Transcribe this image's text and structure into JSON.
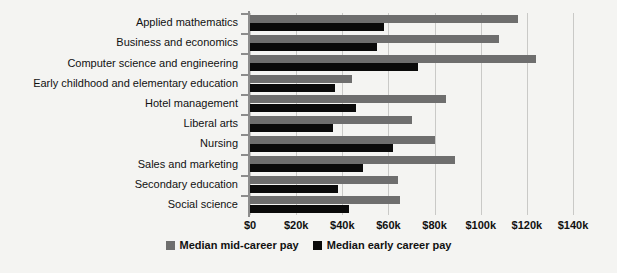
{
  "chart_data": {
    "type": "bar",
    "orientation": "horizontal",
    "title": "",
    "xlabel": "",
    "ylabel": "",
    "xlim": [
      0,
      140000
    ],
    "xticks": [
      0,
      20000,
      40000,
      60000,
      80000,
      100000,
      120000,
      140000
    ],
    "xtick_labels": [
      "$0",
      "$20k",
      "$40k",
      "$60k",
      "$80k",
      "$100k",
      "$120k",
      "$140k"
    ],
    "grid": true,
    "legend_position": "bottom-center",
    "categories": [
      "Applied mathematics",
      "Business and economics",
      "Computer science and engineering",
      "Early childhood and elementary education",
      "Hotel management",
      "Liberal arts",
      "Nursing",
      "Sales and marketing",
      "Secondary education",
      "Social science"
    ],
    "series": [
      {
        "name": "Median mid-career pay",
        "color": "#6e6e6e",
        "values": [
          116000,
          108000,
          124000,
          44000,
          85000,
          70000,
          80000,
          89000,
          64000,
          65000
        ]
      },
      {
        "name": "Median early career pay",
        "color": "#0a0a0a",
        "values": [
          58000,
          55000,
          73000,
          37000,
          46000,
          36000,
          62000,
          49000,
          38000,
          43000
        ]
      }
    ]
  },
  "legend": {
    "items": [
      {
        "label": "Median mid-career pay",
        "swatch": "mid-career-swatch"
      },
      {
        "label": "Median early career pay",
        "swatch": "early-career-swatch"
      }
    ]
  }
}
